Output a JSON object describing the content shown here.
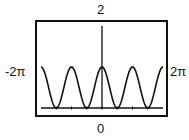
{
  "chart_data": {
    "type": "line",
    "title": "",
    "function": "y = cos^2(x)",
    "xlabel": "",
    "ylabel": "",
    "xlim": [
      -6.2832,
      6.2832
    ],
    "ylim": [
      0,
      2
    ],
    "x_tick_step": 1.5708,
    "grid": false,
    "window_labels": {
      "ymax": "2",
      "ymin": "0",
      "xmin": "-2π",
      "xmax": "2π"
    },
    "x": [
      -6.2832,
      -4.7124,
      -3.1416,
      -1.5708,
      0,
      1.5708,
      3.1416,
      4.7124,
      6.2832
    ],
    "series": [
      {
        "name": "cos²(x)",
        "values": [
          1,
          0,
          1,
          0,
          1,
          0,
          1,
          0,
          1
        ]
      }
    ],
    "colors": {
      "curve": "#111111",
      "axes": "#111111",
      "frame": "#111111"
    }
  }
}
